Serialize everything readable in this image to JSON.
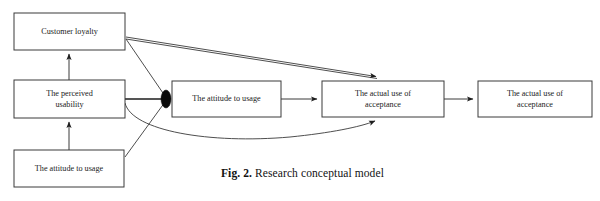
{
  "figure": {
    "caption_prefix": "Fig. 2.",
    "caption_text": " Research conceptual model",
    "top_partial_text": "",
    "colors": {
      "background": "#ffffff",
      "box_stroke": "#3a3a3a",
      "edge_stroke": "#3a3a3a",
      "text": "#222222",
      "junction_dot": "#0a0a0a",
      "caption_text": "#111111"
    },
    "nodes": [
      {
        "id": "customer-loyalty",
        "label": "Customer loyalty",
        "lines": [
          "Customer loyalty"
        ],
        "x": 14,
        "y": 13,
        "w": 111,
        "h": 37
      },
      {
        "id": "perceived-usability",
        "label": "The perceived usability",
        "lines": [
          "The perceived",
          "usability"
        ],
        "x": 14,
        "y": 80,
        "w": 111,
        "h": 38
      },
      {
        "id": "attitude-to-usage-left",
        "label": "The attitude to usage",
        "lines": [
          "The attitude to usage"
        ],
        "x": 14,
        "y": 150,
        "w": 110,
        "h": 37
      },
      {
        "id": "attitude-to-usage-center",
        "label": "The attitude to usage",
        "lines": [
          "The attitude to usage"
        ],
        "x": 172,
        "y": 81,
        "w": 109,
        "h": 36
      },
      {
        "id": "actual-use-acceptance-middle",
        "label": "The actual use of acceptance",
        "lines": [
          "The actual use of",
          "acceptance"
        ],
        "x": 322,
        "y": 81,
        "w": 122,
        "h": 36
      },
      {
        "id": "actual-use-acceptance-right",
        "label": "The actual use of acceptance",
        "lines": [
          "The actual use of",
          "acceptance"
        ],
        "x": 478,
        "y": 81,
        "w": 114,
        "h": 36
      }
    ],
    "junction": {
      "id": "junction-dot",
      "cx": 166,
      "cy": 99,
      "rx": 5,
      "ry": 9
    },
    "edges": [
      {
        "id": "perceived-usability-to-customer-loyalty",
        "from": "perceived-usability",
        "to": "customer-loyalty",
        "arrow": true
      },
      {
        "id": "attitude-left-to-perceived-usability",
        "from": "attitude-to-usage-left",
        "to": "perceived-usability",
        "arrow": true
      },
      {
        "id": "customer-loyalty-to-actual-use",
        "from": "customer-loyalty",
        "to": "actual-use-acceptance-middle",
        "arrow": true
      },
      {
        "id": "customer-loyalty-to-junction",
        "from": "customer-loyalty",
        "to": "junction-dot",
        "arrow": false
      },
      {
        "id": "perceived-usability-to-junction",
        "from": "perceived-usability",
        "to": "junction-dot",
        "arrow": false
      },
      {
        "id": "attitude-left-to-junction",
        "from": "attitude-to-usage-left",
        "to": "junction-dot",
        "arrow": false
      },
      {
        "id": "perceived-usability-curve-to-actual-use",
        "from": "perceived-usability",
        "to": "actual-use-acceptance-middle",
        "arrow": true
      },
      {
        "id": "attitude-center-to-actual-use",
        "from": "attitude-to-usage-center",
        "to": "actual-use-acceptance-middle",
        "arrow": true
      },
      {
        "id": "actual-use-to-actual-use-right",
        "from": "actual-use-acceptance-middle",
        "to": "actual-use-acceptance-right",
        "arrow": true
      }
    ]
  }
}
